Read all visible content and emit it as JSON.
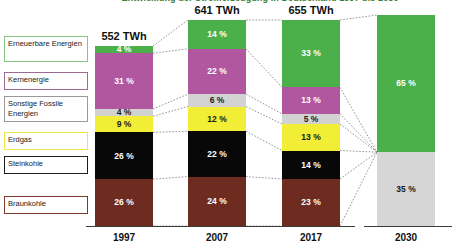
{
  "title": "Entwicklung der Stromerzeugung in Deutschland 1997 bis 2030",
  "legend": {
    "items": [
      {
        "label": "Erneuerbare Energien",
        "color": "#4cb04a",
        "border": "#86c583"
      },
      {
        "label": "Kernenergie",
        "color": "#b057a0",
        "border": "#9c6a93"
      },
      {
        "label": "Sonstige Fossile Energien",
        "color": "#d2d2d2",
        "border": "#9a9a9a"
      },
      {
        "label": "Erdgas",
        "color": "#f2ee35",
        "border": "#ece64a"
      },
      {
        "label": "Steinkohle",
        "color": "#080808",
        "border": "#1d1d1d"
      },
      {
        "label": "Braunkohle",
        "color": "#6e2c20",
        "border": "#7d3a2c"
      }
    ]
  },
  "axis": {
    "years": [
      "1997",
      "2007",
      "2017",
      "2030"
    ]
  },
  "bars": [
    {
      "year": "1997",
      "total_label": "552 TWh",
      "segments": [
        {
          "name": "Erneuerbare Energien",
          "value": "4 %",
          "pct": 4,
          "color": "#4cb04a",
          "text": "#ffffff"
        },
        {
          "name": "Kernenergie",
          "value": "31 %",
          "pct": 31,
          "color": "#b057a0",
          "text": "#ffffff"
        },
        {
          "name": "Sonstige Fossile Energien",
          "value": "4 %",
          "pct": 4,
          "color": "#d2d2d2",
          "text": "#1a1a1a"
        },
        {
          "name": "Erdgas",
          "value": "9 %",
          "pct": 9,
          "color": "#f2ee35",
          "text": "#1a1a1a"
        },
        {
          "name": "Steinkohle",
          "value": "26 %",
          "pct": 26,
          "color": "#080808",
          "text": "#ffffff"
        },
        {
          "name": "Braunkohle",
          "value": "26 %",
          "pct": 26,
          "color": "#6e2c20",
          "text": "#ffffff"
        }
      ]
    },
    {
      "year": "2007",
      "total_label": "641 TWh",
      "segments": [
        {
          "name": "Erneuerbare Energien",
          "value": "14 %",
          "pct": 14,
          "color": "#4cb04a",
          "text": "#ffffff"
        },
        {
          "name": "Kernenergie",
          "value": "22 %",
          "pct": 22,
          "color": "#b057a0",
          "text": "#ffffff"
        },
        {
          "name": "Sonstige Fossile Energien",
          "value": "6 %",
          "pct": 6,
          "color": "#d2d2d2",
          "text": "#1a1a1a"
        },
        {
          "name": "Erdgas",
          "value": "12 %",
          "pct": 12,
          "color": "#f2ee35",
          "text": "#1a1a1a"
        },
        {
          "name": "Steinkohle",
          "value": "22 %",
          "pct": 22,
          "color": "#080808",
          "text": "#ffffff"
        },
        {
          "name": "Braunkohle",
          "value": "24 %",
          "pct": 24,
          "color": "#6e2c20",
          "text": "#ffffff"
        }
      ]
    },
    {
      "year": "2017",
      "total_label": "655 TWh",
      "segments": [
        {
          "name": "Erneuerbare Energien",
          "value": "33 %",
          "pct": 33,
          "color": "#4cb04a",
          "text": "#ffffff"
        },
        {
          "name": "Kernenergie",
          "value": "13 %",
          "pct": 13,
          "color": "#b057a0",
          "text": "#ffffff"
        },
        {
          "name": "Sonstige Fossile Energien",
          "value": "5 %",
          "pct": 5,
          "color": "#d2d2d2",
          "text": "#1a1a1a"
        },
        {
          "name": "Erdgas",
          "value": "13 %",
          "pct": 13,
          "color": "#f2ee35",
          "text": "#1a1a1a"
        },
        {
          "name": "Steinkohle",
          "value": "14 %",
          "pct": 14,
          "color": "#080808",
          "text": "#ffffff"
        },
        {
          "name": "Braunkohle",
          "value": "23 %",
          "pct": 23,
          "color": "#6e2c20",
          "text": "#ffffff"
        }
      ]
    },
    {
      "year": "2030",
      "total_label": "",
      "segments": [
        {
          "name": "Erneuerbare Energien",
          "value": "65 %",
          "pct": 65,
          "color": "#4cb04a",
          "text": "#ffffff"
        },
        {
          "name": "Sonstige",
          "value": "35 %",
          "pct": 35,
          "color": "#d6d6d6",
          "text": "#1a1a1a"
        }
      ]
    }
  ],
  "chart_data": {
    "type": "bar",
    "title": "Entwicklung der Stromerzeugung in Deutschland 1997 bis 2030",
    "xlabel": "",
    "ylabel": "Anteil an der Stromerzeugung (%)",
    "ylim": [
      0,
      100
    ],
    "grid": false,
    "legend_position": "left",
    "stacked": true,
    "categories": [
      "1997",
      "2007",
      "2017",
      "2030"
    ],
    "totals": [
      "552 TWh",
      "641 TWh",
      "655 TWh",
      ""
    ],
    "series": [
      {
        "name": "Erneuerbare Energien",
        "color": "#4cb04a",
        "values": [
          4,
          14,
          33,
          65
        ]
      },
      {
        "name": "Kernenergie",
        "color": "#b057a0",
        "values": [
          31,
          22,
          13,
          0
        ]
      },
      {
        "name": "Sonstige Fossile Energien",
        "color": "#d2d2d2",
        "values": [
          4,
          6,
          5,
          35
        ]
      },
      {
        "name": "Erdgas",
        "color": "#f2ee35",
        "values": [
          9,
          12,
          13,
          0
        ]
      },
      {
        "name": "Steinkohle",
        "color": "#080808",
        "values": [
          26,
          22,
          14,
          0
        ]
      },
      {
        "name": "Braunkohle",
        "color": "#6e2c20",
        "values": [
          26,
          24,
          23,
          0
        ]
      }
    ],
    "annotations": [
      "Dotted grey lines connect matching segment boundaries between adjacent years"
    ]
  }
}
